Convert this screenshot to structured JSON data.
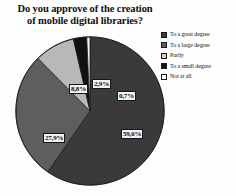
{
  "chart_data": {
    "type": "pie",
    "title": "Do you approve of the creation of mobile digital libraries?",
    "title_line1": "Do you approve of the creation",
    "title_line2": "of mobile digital libraries?",
    "categories": [
      "To a great degree",
      "To a large degree",
      "Partly",
      "To a small degree",
      "Not at all"
    ],
    "values": [
      59.6,
      27.9,
      8.8,
      2.9,
      0.7
    ],
    "labels": [
      "59,6%",
      "27,9%",
      "8,8%",
      "2,9%",
      "0,7%"
    ],
    "colors": [
      "#3a3a3a",
      "#5e5e5e",
      "#b8b8b8",
      "#111111",
      "#f4f4f4"
    ],
    "legend_position": "right",
    "grid": false,
    "xlabel": "",
    "ylabel": "",
    "start_angle_deg": 0,
    "direction": "clockwise",
    "slices": [
      {
        "label": "To a great degree",
        "value": 59.6,
        "display": "59,6%",
        "color": "#3a3a3a"
      },
      {
        "label": "To a large degree",
        "value": 27.9,
        "display": "27,9%",
        "color": "#5e5e5e"
      },
      {
        "label": "Partly",
        "value": 8.8,
        "display": "8,8%",
        "color": "#b8b8b8"
      },
      {
        "label": "To a small degree",
        "value": 2.9,
        "display": "2,9%",
        "color": "#111111"
      },
      {
        "label": "Not at all",
        "value": 0.7,
        "display": "0,7%",
        "color": "#f4f4f4"
      }
    ]
  },
  "legend": {
    "items": [
      {
        "label": "To a great degree",
        "color": "#3a3a3a"
      },
      {
        "label": "To a large degree",
        "color": "#5e5e5e"
      },
      {
        "label": "Partly",
        "color": "#d0d0d0"
      },
      {
        "label": "To a small degree",
        "color": "#111111"
      },
      {
        "label": "Not at all",
        "color": "#fbfbfb"
      }
    ]
  }
}
